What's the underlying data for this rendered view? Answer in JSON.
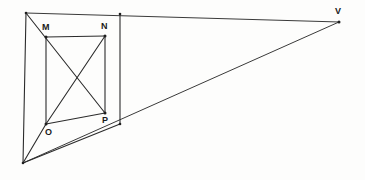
{
  "figure": {
    "background_color": "#fdfdfc",
    "line_color": "#2b2b2b",
    "label_color": "#1a1a1a",
    "vertices": [
      {
        "id": "A",
        "name": "top-left-corner",
        "x": 26,
        "y": 13,
        "label": "",
        "labeled": false
      },
      {
        "id": "B",
        "name": "top-right-of-near-face",
        "x": 120,
        "y": 14,
        "label": "",
        "labeled": false
      },
      {
        "id": "C",
        "name": "bottom-left-corner",
        "x": 23,
        "y": 163,
        "label": "",
        "labeled": false
      },
      {
        "id": "D",
        "name": "bottom-right-of-near-face",
        "x": 120,
        "y": 124,
        "label": "",
        "labeled": false
      },
      {
        "id": "M",
        "name": "point-m",
        "x": 46,
        "y": 37,
        "label": "M",
        "labeled": true,
        "label_x": 42,
        "label_y": 23
      },
      {
        "id": "N",
        "name": "point-n",
        "x": 105,
        "y": 36,
        "label": "N",
        "labeled": true,
        "label_x": 101,
        "label_y": 22
      },
      {
        "id": "O",
        "name": "point-o",
        "x": 46,
        "y": 124,
        "label": "O",
        "labeled": true,
        "label_x": 45,
        "label_y": 128
      },
      {
        "id": "P",
        "name": "point-p",
        "x": 105,
        "y": 113,
        "label": "P",
        "labeled": true,
        "label_x": 102,
        "label_y": 116
      },
      {
        "id": "V",
        "name": "vanishing-point",
        "x": 339,
        "y": 22,
        "label": "V",
        "labeled": true,
        "label_x": 335,
        "label_y": 7
      }
    ],
    "edges": [
      {
        "name": "edge-top-A-to-V",
        "x1": 26,
        "y1": 13,
        "x2": 339,
        "y2": 22,
        "weight": "thin"
      },
      {
        "name": "edge-left-A-to-C",
        "x1": 26,
        "y1": 13,
        "x2": 23,
        "y2": 163,
        "weight": "bold"
      },
      {
        "name": "edge-bottom-C-to-V",
        "x1": 23,
        "y1": 163,
        "x2": 339,
        "y2": 22,
        "weight": "thin"
      },
      {
        "name": "edge-vertical-B-to-D",
        "x1": 120,
        "y1": 14,
        "x2": 120,
        "y2": 124,
        "weight": "bold"
      },
      {
        "name": "edge-rect-M-to-N",
        "x1": 46,
        "y1": 37,
        "x2": 105,
        "y2": 36,
        "weight": "bold"
      },
      {
        "name": "edge-rect-M-to-O",
        "x1": 46,
        "y1": 37,
        "x2": 46,
        "y2": 124,
        "weight": "bold"
      },
      {
        "name": "edge-rect-N-to-P",
        "x1": 105,
        "y1": 36,
        "x2": 105,
        "y2": 113,
        "weight": "bold"
      },
      {
        "name": "edge-rect-O-to-P",
        "x1": 46,
        "y1": 124,
        "x2": 105,
        "y2": 113,
        "weight": "bold"
      },
      {
        "name": "edge-diagonal-A-M-P",
        "x1": 26,
        "y1": 13,
        "x2": 105,
        "y2": 113,
        "weight": "bold"
      },
      {
        "name": "edge-diagonal-N-to-O",
        "x1": 105,
        "y1": 36,
        "x2": 46,
        "y2": 124,
        "weight": "bold"
      },
      {
        "name": "edge-ray-C-to-O",
        "x1": 23,
        "y1": 163,
        "x2": 46,
        "y2": 124,
        "weight": "bold"
      },
      {
        "name": "edge-ray-C-to-D",
        "x1": 23,
        "y1": 163,
        "x2": 120,
        "y2": 124,
        "weight": "bold"
      }
    ]
  }
}
